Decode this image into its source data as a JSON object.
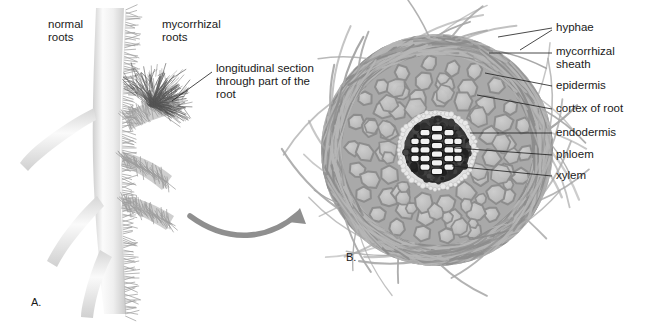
{
  "figure": {
    "background": "#ffffff",
    "ink": "#1a1a1a",
    "cell_fill": "#bcbcbc",
    "cell_wall": "#8d8d8d",
    "hypha_color": "#a7a7a7",
    "stele_dark": "#2f2f2f",
    "xylem_light": "#f2f2f2",
    "arrow_color": "#8f8f8f",
    "root_body": "#ededed"
  },
  "panel_a": {
    "tag": "A.",
    "labels": {
      "normal_roots": "normal\nroots",
      "mycorrhizal_roots": "mycorrhizal\nroots",
      "longitudinal_section": "longitudinal section\nthrough part of the\nroot"
    }
  },
  "panel_b": {
    "tag": "B.",
    "labels": [
      {
        "id": "hyphae",
        "text": "hyphae"
      },
      {
        "id": "mycorrhizal-sheath",
        "text": "mycorrhizal\nsheath"
      },
      {
        "id": "epidermis",
        "text": "epidermis"
      },
      {
        "id": "cortex-of-root",
        "text": "cortex of root"
      },
      {
        "id": "endodermis",
        "text": "endodermis"
      },
      {
        "id": "phloem",
        "text": "phloem"
      },
      {
        "id": "xylem",
        "text": "xylem"
      }
    ]
  }
}
